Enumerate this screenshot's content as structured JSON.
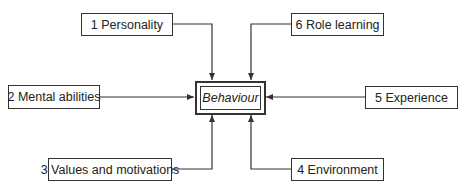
{
  "diagram": {
    "center": {
      "label": "Behaviour"
    },
    "factors": [
      {
        "label": "1 Personality"
      },
      {
        "label": "2 Mental abilities"
      },
      {
        "label": "3 Values and motivations"
      },
      {
        "label": "4 Environment"
      },
      {
        "label": "5 Experience"
      },
      {
        "label": "6 Role learning"
      }
    ],
    "colors": {
      "line": "#333333",
      "background": "#ffffff"
    }
  }
}
